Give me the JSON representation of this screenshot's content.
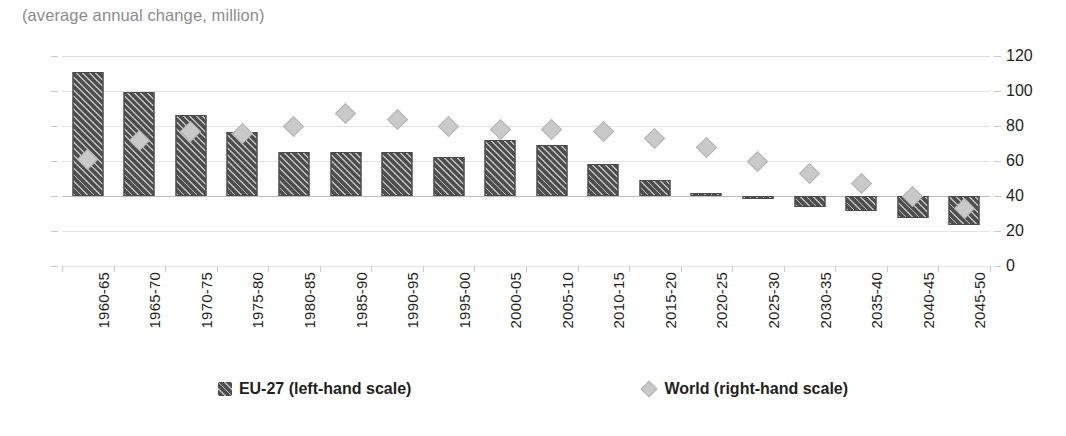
{
  "subtitle": "(average annual change, million)",
  "chart_data": {
    "type": "bar",
    "title": "",
    "subtitle": "(average annual change, million)",
    "xlabel": "",
    "ylabel": "",
    "grid": true,
    "legend_position": "bottom",
    "categories": [
      "1960-65",
      "1965-70",
      "1970-75",
      "1975-80",
      "1980-85",
      "1985-90",
      "1990-95",
      "1995-00",
      "2000-05",
      "2005-10",
      "2010-15",
      "2015-20",
      "2020-25",
      "2025-30",
      "2030-35",
      "2035-40",
      "2040-45",
      "2045-50"
    ],
    "axes": {
      "left": {
        "label": "EU-27 (left-hand scale)",
        "ticks": [
          4,
          3,
          2,
          1,
          0,
          -1,
          -2
        ],
        "ylim": [
          -2,
          4
        ]
      },
      "right": {
        "label": "World (right-hand scale)",
        "ticks": [
          120,
          100,
          80,
          60,
          40,
          20,
          0
        ],
        "ylim": [
          0,
          120
        ]
      }
    },
    "series": [
      {
        "name": "EU-27 (left-hand scale)",
        "axis": "left",
        "mark": "bar",
        "color": "#4f4f4f",
        "values": [
          3.55,
          2.97,
          2.32,
          1.82,
          1.25,
          1.27,
          1.25,
          1.11,
          1.6,
          1.46,
          0.92,
          0.47,
          0.1,
          -0.09,
          -0.3,
          -0.42,
          -0.62,
          -0.82
        ]
      },
      {
        "name": "World (right-hand scale)",
        "axis": "right",
        "mark": "diamond",
        "color": "#c9c9c9",
        "values": [
          61,
          72,
          77,
          76,
          80,
          87,
          84,
          80,
          78,
          78,
          77,
          73,
          68,
          60,
          53,
          47,
          40,
          33
        ]
      }
    ]
  },
  "legend": {
    "items": [
      {
        "label": "EU-27 (left-hand scale)",
        "swatch": "hatched-bar-swatch"
      },
      {
        "label": "World (right-hand scale)",
        "swatch": "diamond-swatch"
      }
    ]
  },
  "colors": {
    "bar": "#4f4f4f",
    "diamond": "#c9c9c9",
    "gridline": "#e3e3e3",
    "text": "#231f20",
    "subtitle": "#8c8c8c"
  }
}
